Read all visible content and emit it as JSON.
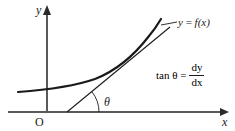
{
  "figure": {
    "name": "derivative-tangent-slope-diagram",
    "background_color": "#ffffff",
    "ink_color": "#1a1a1a",
    "axis_color": "#555555",
    "width": 235,
    "height": 131,
    "axes": {
      "y_axis_label": "y",
      "x_axis_label": "x",
      "origin_label": "O",
      "x_axis_y": 112,
      "y_axis_x": 47,
      "x_axis_start": 8,
      "x_axis_end": 228,
      "y_axis_top": 10
    },
    "angle": {
      "symbol": "θ",
      "vertex_x": 67,
      "vertex_y": 112,
      "arc_radius": 30
    },
    "curve": {
      "label_text_parts": {
        "y": "y",
        "equals": " = ",
        "f": "f",
        "arg": "(x)"
      },
      "label_full": "y = f(x)",
      "description": "increasing convex curve, exponential-like",
      "points": [
        [
          18,
          92
        ],
        [
          40,
          90
        ],
        [
          60,
          88
        ],
        [
          80,
          84
        ],
        [
          100,
          77
        ],
        [
          118,
          67
        ],
        [
          133,
          55
        ],
        [
          145,
          42
        ],
        [
          154,
          30
        ],
        [
          160,
          20
        ]
      ]
    },
    "tangent_line": {
      "from": [
        67,
        112
      ],
      "to": [
        170,
        27
      ],
      "touch_point": [
        136,
        57
      ]
    },
    "leader_line": {
      "from": [
        176,
        22
      ],
      "to": [
        162,
        25
      ]
    },
    "formula": {
      "lhs": "tan θ =",
      "numerator": "dy",
      "denominator": "dx",
      "full": "tan θ = dy/dx"
    }
  }
}
